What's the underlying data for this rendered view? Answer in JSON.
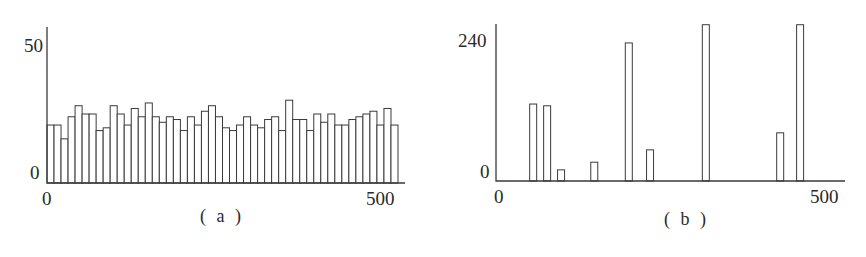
{
  "chart_data": [
    {
      "id": "a",
      "type": "bar",
      "caption": "( a )",
      "title": "",
      "xlabel": "",
      "ylabel": "",
      "x_tick_labels": [
        "0",
        "500"
      ],
      "y_tick_labels": [
        "0",
        "50"
      ],
      "xlim": [
        0,
        500
      ],
      "ylim": [
        0,
        50
      ],
      "grid": false,
      "legend": null,
      "bar_style": "outlined histogram, uniform bins",
      "values": [
        21,
        21,
        16,
        24,
        28,
        25,
        25,
        19,
        20,
        28,
        25,
        21,
        27,
        24,
        29,
        24,
        22,
        24,
        23,
        19,
        24,
        21,
        26,
        28,
        24,
        20,
        19,
        21,
        24,
        21,
        20,
        23,
        24,
        19,
        30,
        23,
        23,
        19,
        25,
        22,
        25,
        21,
        21,
        23,
        24,
        25,
        26,
        21,
        27,
        21
      ]
    },
    {
      "id": "b",
      "type": "bar",
      "caption": "( b )",
      "title": "",
      "xlabel": "",
      "ylabel": "",
      "x_tick_labels": [
        "0",
        "500"
      ],
      "y_tick_labels": [
        "0",
        "240"
      ],
      "xlim": [
        0,
        520
      ],
      "ylim": [
        0,
        270
      ],
      "grid": false,
      "legend": null,
      "bar_style": "outlined narrow spikes, sparse histogram",
      "x": [
        56,
        77,
        98,
        148,
        200,
        232,
        316,
        428,
        458
      ],
      "values": [
        131,
        128,
        19,
        32,
        235,
        53,
        266,
        82,
        266
      ]
    }
  ],
  "panels": {
    "a": {
      "caption": "( a )",
      "y_max_label": "50",
      "y_min_label": "0",
      "x_min_label": "0",
      "x_max_label": "500"
    },
    "b": {
      "caption": "( b )",
      "y_max_label": "240",
      "y_min_label": "0",
      "x_min_label": "0",
      "x_max_label": "500"
    }
  }
}
